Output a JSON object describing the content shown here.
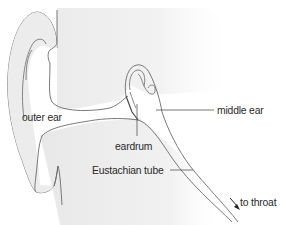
{
  "diagram": {
    "labels": {
      "outer_ear": "outer ear",
      "middle_ear": "middle ear",
      "eardrum": "eardrum",
      "eustachian_tube": "Eustachian tube",
      "to_throat": "to throat"
    },
    "colors": {
      "shading": "#e9e9e9",
      "shading_light": "#f3f3f3",
      "outline": "#6a6a6a",
      "text": "#2a2a2a",
      "background": "#ffffff"
    }
  }
}
